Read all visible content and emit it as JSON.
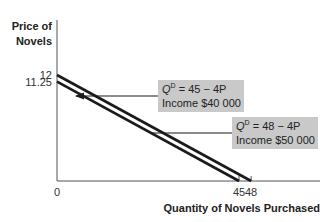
{
  "chart_data": {
    "type": "line",
    "title": "",
    "xlabel": "Quantity of Novels Purchased",
    "ylabel_lines": [
      "Price of",
      "Novels"
    ],
    "xlim": [
      0,
      55
    ],
    "ylim": [
      0,
      14.7
    ],
    "x_ticks": [
      {
        "value": 0,
        "label": "0"
      },
      {
        "value": 45,
        "label": "45"
      },
      {
        "value": 48,
        "label": "48"
      }
    ],
    "y_ticks": [
      {
        "value": 12,
        "label": "12"
      },
      {
        "value": 11.25,
        "label": "11.25"
      }
    ],
    "grid": false,
    "series": [
      {
        "name": "Income $50 000",
        "equation_prefix": "Q",
        "equation_sup": "D",
        "equation_rest": " = 48 − 4P",
        "income": "Income $50 000",
        "points": [
          [
            0,
            12
          ],
          [
            48,
            0
          ]
        ]
      },
      {
        "name": "Income $40 000",
        "equation_prefix": "Q",
        "equation_sup": "D",
        "equation_rest": " = 45 − 4P",
        "income": "Income $40 000",
        "points": [
          [
            0,
            11.25
          ],
          [
            45,
            0
          ]
        ]
      }
    ],
    "annotations": [
      {
        "text": "Q^D = 45 − 4P / Income $40 000",
        "points_to": "Income $40 000 curve"
      },
      {
        "text": "Q^D = 48 − 4P / Income $50 000",
        "points_to": "shift arrow between curves"
      }
    ]
  },
  "colors": {
    "line": "#1a1a1a",
    "box": "#c9c9c9",
    "axis": "#555555"
  }
}
